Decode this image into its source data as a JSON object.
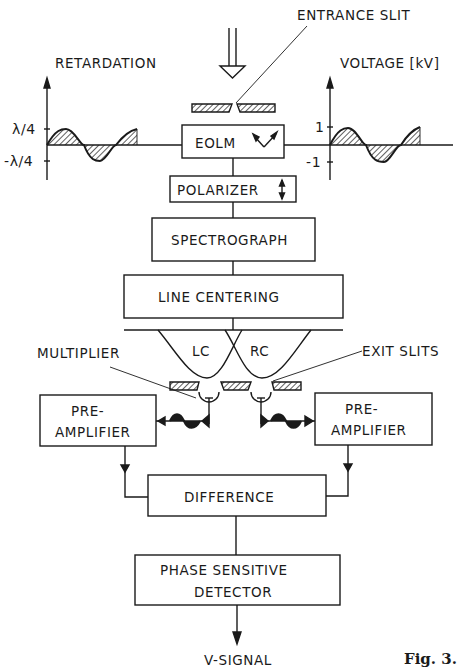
{
  "figure": {
    "caption": "Fig. 3.",
    "type": "block-diagram"
  },
  "labels": {
    "entrance_slit": "ENTRANCE SLIT",
    "retardation": "RETARDATION",
    "voltage": "VOLTAGE [kV]",
    "multiplier": "MULTIPLIER",
    "exit_slits": "EXIT SLITS",
    "lc": "LC",
    "rc": "RC",
    "output": "V-SIGNAL"
  },
  "retardation_axis": {
    "tick_top": "λ/4",
    "tick_bottom": "-λ/4"
  },
  "voltage_axis": {
    "tick_top": "1",
    "tick_bottom": "-1"
  },
  "blocks": {
    "eolm": "EOLM",
    "polarizer": "POLARIZER",
    "spectrograph": "SPECTROGRAPH",
    "line_centering": "LINE CENTERING",
    "preamp_left_line1": "PRE-",
    "preamp_left_line2": "AMPLIFIER",
    "preamp_right_line1": "PRE-",
    "preamp_right_line2": "AMPLIFIER",
    "difference": "DIFFERENCE",
    "psd_line1": "PHASE SENSITIVE",
    "psd_line2": "DETECTOR"
  },
  "colors": {
    "ink": "#1a1a1a",
    "background": "#ffffff"
  }
}
